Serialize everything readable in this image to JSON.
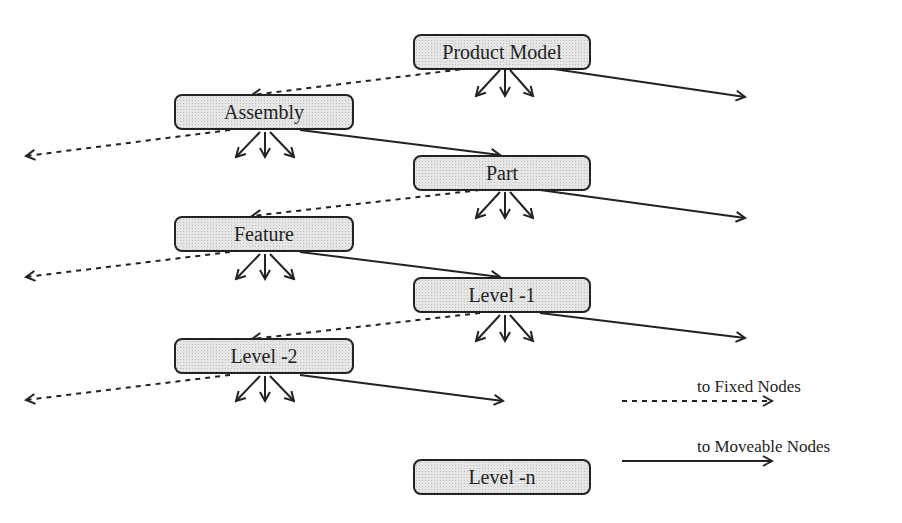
{
  "nodes": [
    {
      "id": "product-model",
      "label": "Product Model"
    },
    {
      "id": "assembly",
      "label": "Assembly"
    },
    {
      "id": "part",
      "label": "Part"
    },
    {
      "id": "feature",
      "label": "Feature"
    },
    {
      "id": "level-1",
      "label": "Level -1"
    },
    {
      "id": "level-2",
      "label": "Level -2"
    },
    {
      "id": "level-n",
      "label": "Level -n"
    }
  ],
  "legend": {
    "fixed": "to Fixed Nodes",
    "moveable": "to Moveable Nodes"
  },
  "colors": {
    "line": "#222222",
    "node_fill": "#e6e6e6"
  }
}
